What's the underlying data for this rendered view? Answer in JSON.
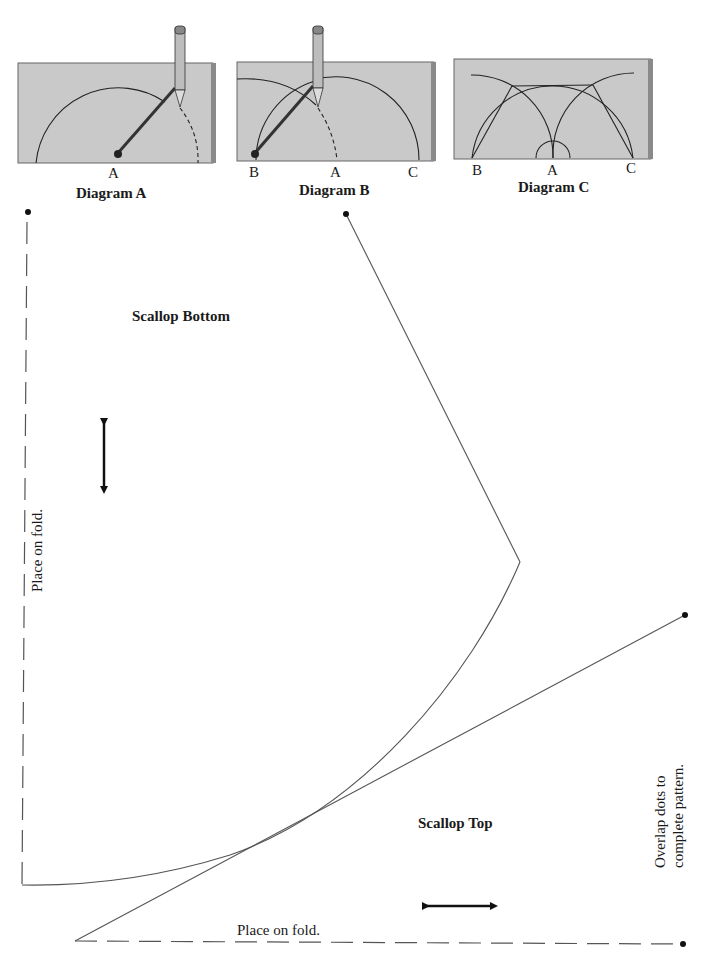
{
  "diagrams": [
    {
      "id": "A",
      "caption": "Diagram A",
      "points": [
        "A"
      ]
    },
    {
      "id": "B",
      "caption": "Diagram B",
      "points": [
        "B",
        "A",
        "C"
      ]
    },
    {
      "id": "C",
      "caption": "Diagram C",
      "points": [
        "B",
        "A",
        "C"
      ]
    }
  ],
  "pattern": {
    "scallop_bottom": {
      "title": "Scallop Bottom",
      "fold_label": "Place on fold.",
      "grainline": "vertical-double-arrow"
    },
    "scallop_top": {
      "title": "Scallop Top",
      "fold_label": "Place on fold.",
      "grainline": "horizontal-double-arrow"
    },
    "note_line1": "Overlap dots to",
    "note_line2": "complete pattern."
  },
  "colors": {
    "paper": "#c9c9c9",
    "paper_edge": "#8a8a8a",
    "line": "#555555",
    "ink": "#111111"
  }
}
